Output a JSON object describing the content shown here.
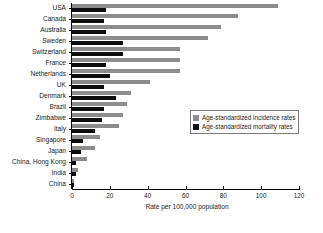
{
  "chart_data": {
    "type": "bar",
    "orientation": "horizontal",
    "title": "",
    "xlabel": "Rate per 100,000 population",
    "ylabel": "",
    "xlim": [
      0,
      120
    ],
    "xticks": [
      0,
      20,
      40,
      60,
      80,
      100,
      120
    ],
    "grid": false,
    "legend_position": "middle-right",
    "categories": [
      "USA",
      "Canada",
      "Australia",
      "Sweden",
      "Switzerland",
      "France",
      "Netherlands",
      "UK",
      "Denmark",
      "Brazil",
      "Zimbabwe",
      "Italy",
      "Singapore",
      "Japan",
      "China, Hong Kong",
      "India",
      "China"
    ],
    "series": [
      {
        "name": "Age-standardized incidence rates",
        "color": "#8c8c8c",
        "values": [
          109,
          88,
          79,
          72,
          57,
          57,
          57,
          41,
          31,
          29,
          27,
          25,
          15,
          12,
          8,
          3,
          1
        ]
      },
      {
        "name": "Age-standardized mortality rates",
        "color": "#0d0d0d",
        "values": [
          18,
          17,
          18,
          27,
          27,
          18,
          20,
          17,
          23,
          17,
          16,
          12,
          6,
          5,
          2,
          2,
          1
        ]
      }
    ]
  },
  "legend": {
    "items": [
      {
        "label": "Age-standardized incidence rates",
        "swatch": "incidence-swatch"
      },
      {
        "label": "Age-standardized mortality rates",
        "swatch": "mortality-swatch"
      }
    ]
  }
}
